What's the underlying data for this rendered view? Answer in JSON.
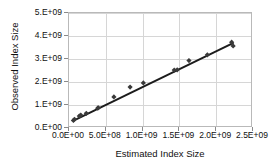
{
  "chart_data": {
    "type": "scatter",
    "title": "",
    "xlabel": "Estimated Index Size",
    "ylabel": "Observed Index Size",
    "xlim": [
      0,
      2500000000
    ],
    "ylim": [
      0,
      5000000000
    ],
    "grid": true,
    "legend": null,
    "xticks": [
      {
        "value": 0,
        "label": "0.0E+00"
      },
      {
        "value": 500000000,
        "label": "5.0E+08"
      },
      {
        "value": 1000000000,
        "label": "1.0E+09"
      },
      {
        "value": 1500000000,
        "label": "1.5E+09"
      },
      {
        "value": 2000000000,
        "label": "2.0E+09"
      },
      {
        "value": 2500000000,
        "label": "2.5E+09"
      }
    ],
    "yticks": [
      {
        "value": 0,
        "label": "0.E+00"
      },
      {
        "value": 1000000000,
        "label": "1.E+09"
      },
      {
        "value": 2000000000,
        "label": "2.E+09"
      },
      {
        "value": 3000000000,
        "label": "3.E+09"
      },
      {
        "value": 4000000000,
        "label": "4.E+09"
      },
      {
        "value": 5000000000,
        "label": "5.E+09"
      }
    ],
    "series": [
      {
        "name": "observed vs estimated",
        "marker": "diamond",
        "marker_color": "#3a3a3a",
        "points": [
          {
            "x": 60000000,
            "y": 330000000
          },
          {
            "x": 75000000,
            "y": 380000000
          },
          {
            "x": 140000000,
            "y": 520000000
          },
          {
            "x": 160000000,
            "y": 560000000
          },
          {
            "x": 235000000,
            "y": 640000000
          },
          {
            "x": 390000000,
            "y": 860000000
          },
          {
            "x": 400000000,
            "y": 880000000
          },
          {
            "x": 610000000,
            "y": 1350000000
          },
          {
            "x": 830000000,
            "y": 1780000000
          },
          {
            "x": 1010000000,
            "y": 1960000000
          },
          {
            "x": 1430000000,
            "y": 2520000000
          },
          {
            "x": 1470000000,
            "y": 2530000000
          },
          {
            "x": 1630000000,
            "y": 2930000000
          },
          {
            "x": 1880000000,
            "y": 3180000000
          },
          {
            "x": 2210000000,
            "y": 3730000000
          },
          {
            "x": 2230000000,
            "y": 3570000000
          }
        ]
      }
    ],
    "trendline": {
      "name": "linear fit",
      "color": "#1c1c1c",
      "width": 2,
      "x_start": 55000000,
      "y_start": 310000000,
      "x_end": 2235000000,
      "y_end": 3700000000
    }
  }
}
